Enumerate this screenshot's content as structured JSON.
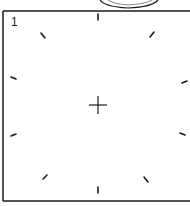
{
  "diagram": {
    "frame_number": "1",
    "colors": {
      "ink": "#1a1a1a",
      "background": "#ffffff"
    },
    "center_marker": "crosshair",
    "tick_marks": [
      {
        "name": "top",
        "x": 98,
        "y": 17,
        "angle": 90
      },
      {
        "name": "top-left",
        "x": 43,
        "y": 35,
        "angle": 45
      },
      {
        "name": "top-right",
        "x": 152,
        "y": 35,
        "angle": -45
      },
      {
        "name": "left-upper",
        "x": 13,
        "y": 78,
        "angle": 15
      },
      {
        "name": "right-upper",
        "x": 184,
        "y": 82,
        "angle": -20
      },
      {
        "name": "left-lower",
        "x": 13,
        "y": 135,
        "angle": -20
      },
      {
        "name": "right-lower",
        "x": 182,
        "y": 134,
        "angle": 20
      },
      {
        "name": "bottom-left",
        "x": 45,
        "y": 177,
        "angle": -45
      },
      {
        "name": "bottom-right",
        "x": 146,
        "y": 179,
        "angle": 45
      },
      {
        "name": "bottom",
        "x": 98,
        "y": 190,
        "angle": 90
      }
    ]
  }
}
